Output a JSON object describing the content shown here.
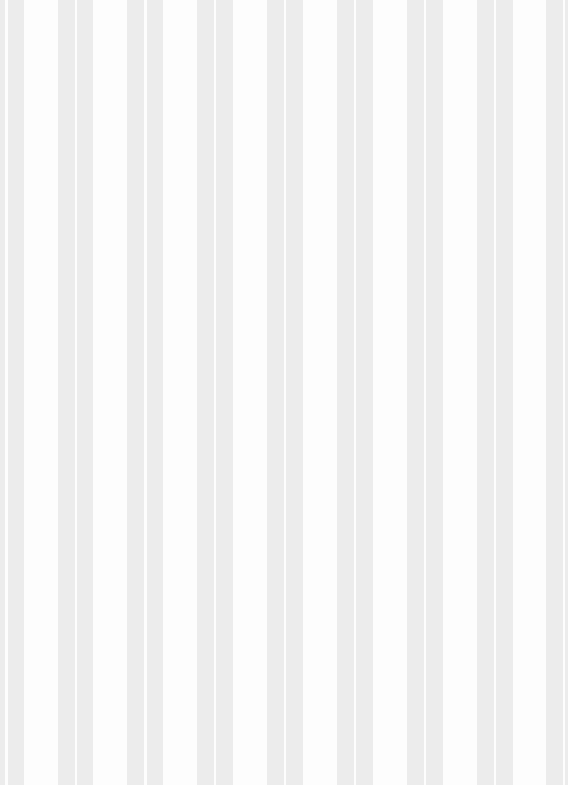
{
  "pattern": {
    "type": "vertical-stripes",
    "background_color": "#fdfdfd",
    "stripe_color": "#ececec",
    "stripes": [
      {
        "x": 0,
        "width": 5
      },
      {
        "x": 8,
        "width": 16
      },
      {
        "x": 58,
        "width": 17
      },
      {
        "x": 77,
        "width": 16
      },
      {
        "x": 127,
        "width": 17
      },
      {
        "x": 147,
        "width": 16
      },
      {
        "x": 197,
        "width": 17
      },
      {
        "x": 216,
        "width": 17
      },
      {
        "x": 267,
        "width": 17
      },
      {
        "x": 286,
        "width": 17
      },
      {
        "x": 337,
        "width": 17
      },
      {
        "x": 356,
        "width": 17
      },
      {
        "x": 407,
        "width": 17
      },
      {
        "x": 426,
        "width": 17
      },
      {
        "x": 477,
        "width": 17
      },
      {
        "x": 496,
        "width": 17
      },
      {
        "x": 546,
        "width": 17
      },
      {
        "x": 565,
        "width": 3
      }
    ]
  }
}
